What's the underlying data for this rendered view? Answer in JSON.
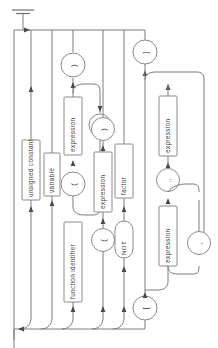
{
  "diagram": {
    "kind": "railroad-syntax-diagram",
    "orientation": "rotated-90-clockwise",
    "title": "factor",
    "background": "#ffffff",
    "line_color": "#7c7c7c",
    "box_stroke": "#8a8a8a",
    "text_color": "#3a3a3a"
  },
  "nodes": {
    "unsigned_constant": "unsigned constant",
    "variable": "variable",
    "function_identifier": "function identifier",
    "expression_1": "expression",
    "expression_2": "expression",
    "expression_3": "expression",
    "expression_4": "expression",
    "factor": "factor",
    "not_keyword": "NOT"
  },
  "terminals": {
    "lparen_call": "(",
    "rparen_call": ")",
    "comma_call": ",",
    "lparen_group": "(",
    "rparen_group": ")",
    "lbracket_set": "[",
    "rbracket_set": "]",
    "comma_set": ",",
    "range_dots": "..",
    "comma_range": ","
  },
  "markers": {
    "start": "start-terminus",
    "end": "end-rail"
  },
  "branches": [
    {
      "id": "b1",
      "label": "unsigned constant"
    },
    {
      "id": "b2",
      "label": "variable"
    },
    {
      "id": "b3",
      "label": "function identifier ( expression , ... )"
    },
    {
      "id": "b4",
      "label": "( expression )"
    },
    {
      "id": "b5",
      "label": "NOT factor"
    },
    {
      "id": "b6",
      "label": "[ expression .. expression , ... ]"
    }
  ]
}
